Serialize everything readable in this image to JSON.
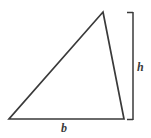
{
  "figure": {
    "background_color": "#ffffff",
    "stroke_color": "#3a3a3a",
    "stroke_width": 1.6,
    "width": 151,
    "height": 138
  },
  "labels": {
    "height_label": "h",
    "base_label": "b"
  },
  "shapes": {
    "triangle": {
      "name": "triangle",
      "apex": {
        "x": 103,
        "y": 12
      },
      "bottom_left": {
        "x": 9,
        "y": 119
      },
      "bottom_right": {
        "x": 124,
        "y": 119
      },
      "points": "103,12 124,119 9,119"
    },
    "height_bracket": {
      "name": "height-bracket",
      "x": 133,
      "top_y": 12,
      "bottom_y": 120,
      "cap_length": 6
    }
  }
}
